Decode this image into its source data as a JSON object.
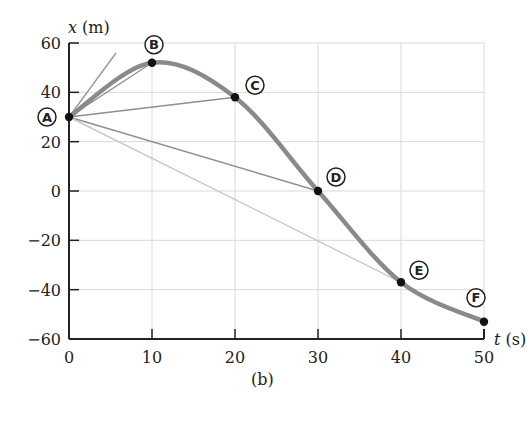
{
  "figure": {
    "caption": "(b)"
  },
  "chart_data": {
    "type": "line",
    "title": "",
    "xlabel": "t (s)",
    "ylabel": "x (m)",
    "xlim": [
      0,
      50
    ],
    "ylim": [
      -60,
      60
    ],
    "x_ticks": [
      0,
      10,
      20,
      30,
      40,
      50
    ],
    "x_tick_labels": [
      "0",
      "10",
      "20",
      "30",
      "40",
      "50"
    ],
    "y_ticks": [
      -60,
      -40,
      -20,
      0,
      20,
      40,
      60
    ],
    "y_tick_labels": [
      "−60",
      "−40",
      "−20",
      "0",
      "20",
      "40",
      "60"
    ],
    "grid": true,
    "legend": null,
    "series": [
      {
        "name": "position vs time",
        "color": "#8a8a8a",
        "curve": "smooth",
        "points": [
          {
            "label": "A",
            "t": 0,
            "x": 30
          },
          {
            "label": "B",
            "t": 10,
            "x": 52
          },
          {
            "label": "C",
            "t": 20,
            "x": 38
          },
          {
            "label": "D",
            "t": 30,
            "x": 0
          },
          {
            "label": "E",
            "t": 40,
            "x": -37
          },
          {
            "label": "F",
            "t": 50,
            "x": -53
          }
        ]
      }
    ],
    "annotations": [
      {
        "type": "secant",
        "from": "A",
        "to": "B",
        "color": "#8f8f8f"
      },
      {
        "type": "secant",
        "from": "A",
        "to": "C",
        "color": "#8f8f8f"
      },
      {
        "type": "secant",
        "from": "A",
        "to": "D",
        "color": "#8f8f8f"
      },
      {
        "type": "secant",
        "from": "A",
        "to": "E",
        "color": "#c8c8c8"
      },
      {
        "type": "tangent",
        "at": "A",
        "color": "#9a9a9a"
      }
    ]
  }
}
